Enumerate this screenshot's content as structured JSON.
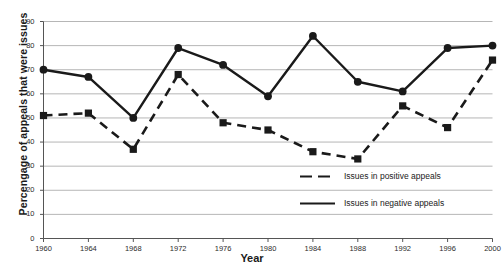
{
  "chart_data": {
    "type": "line",
    "title": "",
    "xlabel": "Year",
    "ylabel": "Percengage of appeals that were issues",
    "categories": [
      1960,
      1964,
      1968,
      1972,
      1976,
      1980,
      1984,
      1988,
      1992,
      1996,
      2000
    ],
    "xlim": [
      1960,
      2000
    ],
    "ylim": [
      0,
      90
    ],
    "ytick_step": 10,
    "yticks": [
      0,
      10,
      20,
      30,
      40,
      50,
      60,
      70,
      80,
      90
    ],
    "xticks": [
      1960,
      1964,
      1968,
      1972,
      1976,
      1980,
      1984,
      1988,
      1992,
      1996,
      2000
    ],
    "grid": "horizontal",
    "legend_position": "inside-lower-right",
    "series": [
      {
        "name": "Issues in negative appeals",
        "style": "solid",
        "marker": "circle",
        "color": "#1a1a1a",
        "values": [
          70,
          67,
          50,
          79,
          72,
          59,
          84,
          65,
          61,
          79,
          80
        ]
      },
      {
        "name": "Issues in positive appeals",
        "style": "dashed",
        "marker": "square",
        "color": "#1a1a1a",
        "values": [
          51,
          52,
          37,
          68,
          48,
          45,
          36,
          33,
          55,
          46,
          74
        ]
      }
    ]
  },
  "axis": {
    "y_title": "Percengage of appeals that were issues",
    "x_title": "Year",
    "y_tick_labels": [
      "90",
      "80",
      "70",
      "60",
      "50",
      "40",
      "30",
      "20",
      "10",
      "0"
    ],
    "x_tick_labels": [
      "1960",
      "1964",
      "1968",
      "1972",
      "1976",
      "1980",
      "1984",
      "1988",
      "1992",
      "1996",
      "2000"
    ]
  },
  "legend": {
    "entries": [
      {
        "label": "Issues in positive appeals",
        "style": "dashed"
      },
      {
        "label": "Issues in negative appeals",
        "style": "solid"
      }
    ]
  },
  "colors": {
    "series": "#1a1a1a",
    "grid": "#aeaeae",
    "axis": "#555555",
    "background": "#ffffff"
  }
}
